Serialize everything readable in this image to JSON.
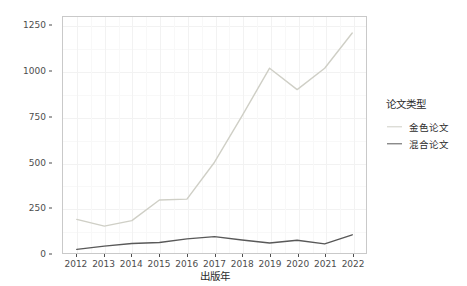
{
  "chart_data": {
    "type": "line",
    "title": "",
    "xlabel": "出版年",
    "ylabel": "APC费用（万元）",
    "x": [
      2012,
      2013,
      2014,
      2015,
      2016,
      2017,
      2018,
      2019,
      2020,
      2021,
      2022
    ],
    "categories": [
      "2012",
      "2013",
      "2014",
      "2015",
      "2016",
      "2017",
      "2018",
      "2019",
      "2020",
      "2021",
      "2022"
    ],
    "series": [
      {
        "name": "金色论文",
        "color": "#cfcfc6",
        "values": [
          185,
          148,
          178,
          292,
          297,
          500,
          755,
          1018,
          900,
          1018,
          1212
        ]
      },
      {
        "name": "混合论文",
        "color": "#595959",
        "values": [
          20,
          38,
          52,
          58,
          78,
          90,
          72,
          55,
          70,
          50,
          100
        ]
      }
    ],
    "ylim": [
      0,
      1300
    ],
    "yticks": [
      0,
      250,
      500,
      750,
      1000,
      1250
    ],
    "ytick_labels": [
      "0",
      "250",
      "500",
      "750",
      "1000",
      "1250"
    ],
    "xlim": [
      2011.5,
      2022.5
    ],
    "grid": true,
    "legend_position": "right",
    "legend_title": "论文类型"
  },
  "legend": {
    "title": "论文类型",
    "items": [
      {
        "label": "金色论文",
        "color": "#cfcfc6"
      },
      {
        "label": "混合论文",
        "color": "#595959"
      }
    ]
  },
  "axes": {
    "y_title": "APC费用（万元）",
    "x_title": "出版年",
    "y_tick_labels": [
      "1250",
      "1000",
      "750",
      "500",
      "250",
      "0"
    ],
    "x_tick_labels": [
      "2012",
      "2013",
      "2014",
      "2015",
      "2016",
      "2017",
      "2018",
      "2019",
      "2020",
      "2021",
      "2022"
    ]
  }
}
